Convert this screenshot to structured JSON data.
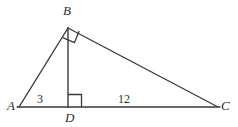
{
  "figure": {
    "kind": "geometry-diagram",
    "shape": "right-triangle-with-altitude",
    "background_color": "#ffffff",
    "stroke_color": "#3a3a3a",
    "label_color": "#2e2e2e"
  },
  "vertices": {
    "A": {
      "label": "A",
      "x": 19,
      "y": 107
    },
    "B": {
      "label": "B",
      "x": 68,
      "y": 28
    },
    "C": {
      "label": "C",
      "x": 218,
      "y": 107
    },
    "D": {
      "label": "D",
      "x": 68,
      "y": 107
    }
  },
  "segments": [
    {
      "name": "AB",
      "from": "A",
      "to": "B"
    },
    {
      "name": "BC",
      "from": "B",
      "to": "C"
    },
    {
      "name": "AC",
      "from": "A",
      "to": "C"
    },
    {
      "name": "BD",
      "from": "B",
      "to": "D"
    }
  ],
  "segment_labels": {
    "AD": "3",
    "DC": "12"
  },
  "right_angles": [
    {
      "at": "B",
      "between": "BA and BC"
    },
    {
      "at": "D",
      "between": "DB and DC"
    }
  ]
}
